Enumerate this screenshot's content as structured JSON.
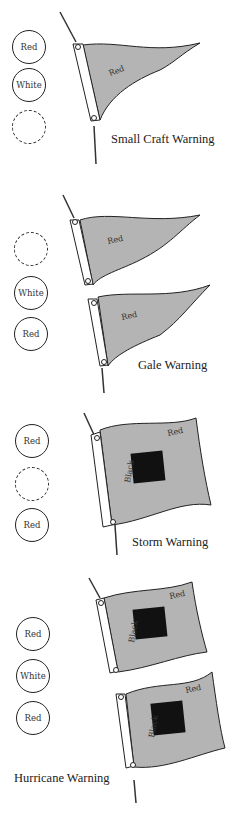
{
  "colors": {
    "flag_red_fill": "#b4b4b4",
    "flag_black_fill": "#111111",
    "outline": "#222222",
    "background": "#ffffff"
  },
  "warnings": [
    {
      "caption": "Small Craft Warning",
      "lights": [
        {
          "label": "Red",
          "style": "solid"
        },
        {
          "label": "White",
          "style": "solid"
        },
        {
          "label": "",
          "style": "dashed"
        }
      ],
      "flags": [
        {
          "shape": "pennant",
          "label": "Red"
        }
      ]
    },
    {
      "caption": "Gale Warning",
      "lights": [
        {
          "label": "",
          "style": "dashed"
        },
        {
          "label": "White",
          "style": "solid"
        },
        {
          "label": "Red",
          "style": "solid"
        }
      ],
      "flags": [
        {
          "shape": "pennant",
          "label": "Red"
        },
        {
          "shape": "pennant",
          "label": "Red"
        }
      ]
    },
    {
      "caption": "Storm Warning",
      "lights": [
        {
          "label": "Red",
          "style": "solid"
        },
        {
          "label": "",
          "style": "dashed"
        },
        {
          "label": "Red",
          "style": "solid"
        }
      ],
      "flags": [
        {
          "shape": "square",
          "label": "Red",
          "center_label": "Black"
        }
      ]
    },
    {
      "caption": "Hurricane Warning",
      "lights": [
        {
          "label": "Red",
          "style": "solid"
        },
        {
          "label": "White",
          "style": "solid"
        },
        {
          "label": "Red",
          "style": "solid"
        }
      ],
      "flags": [
        {
          "shape": "square",
          "label": "Red",
          "center_label": "Black"
        },
        {
          "shape": "square",
          "label": "Red",
          "center_label": "Black"
        }
      ]
    }
  ]
}
